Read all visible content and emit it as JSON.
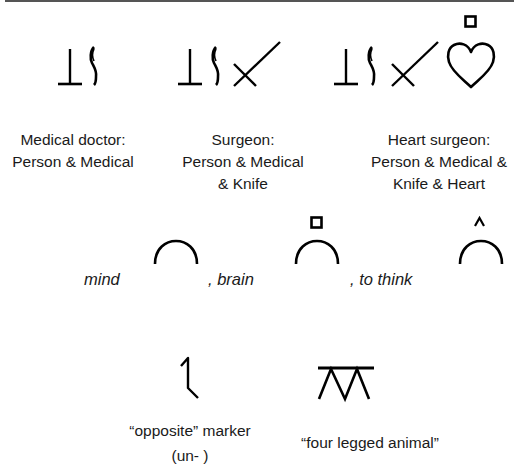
{
  "figure": {
    "row1": {
      "groups": [
        {
          "id": "medical-doctor",
          "title": "Medical doctor:",
          "lines": [
            "Person & Medical"
          ],
          "symbols": [
            "person",
            "medical"
          ]
        },
        {
          "id": "surgeon",
          "title": "Surgeon:",
          "lines": [
            "Person & Medical",
            "& Knife"
          ],
          "symbols": [
            "person",
            "medical",
            "knife"
          ]
        },
        {
          "id": "heart-surgeon",
          "title": "Heart surgeon:",
          "lines": [
            "Person & Medical &",
            "Knife & Heart"
          ],
          "symbols": [
            "person",
            "medical",
            "knife",
            "heart",
            "square-indicator"
          ]
        }
      ]
    },
    "row2": {
      "items": [
        {
          "word": "mind",
          "symbol": "mind-arc",
          "indicator": "none"
        },
        {
          "word": ", brain",
          "symbol": "mind-arc",
          "indicator": "square-indicator"
        },
        {
          "word": ", to think",
          "symbol": "mind-arc",
          "indicator": "caret-indicator"
        }
      ]
    },
    "row3": {
      "items": [
        {
          "symbol": "opposite-marker",
          "lines": [
            "“opposite” marker",
            "(un- )"
          ]
        },
        {
          "symbol": "four-legged-animal",
          "lines": [
            "“four legged animal”"
          ]
        }
      ]
    },
    "caption_cut_off": "Figure ... (text cut off at bottom edge)"
  }
}
